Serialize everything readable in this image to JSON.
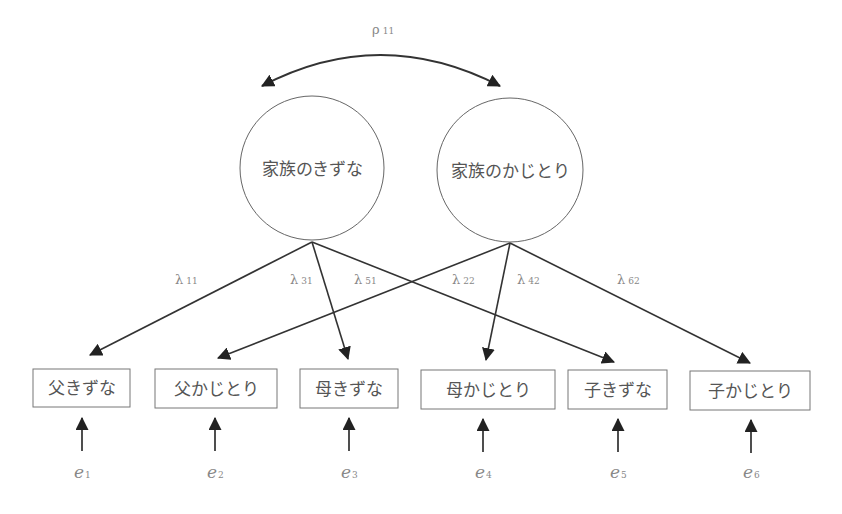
{
  "diagram": {
    "type": "structural-equation-model",
    "colors": {
      "line": "#333333",
      "text": "#555555",
      "param_text": "#888888",
      "background": "#ffffff"
    },
    "correlation": {
      "symbol": "ρ",
      "subscript": "11"
    },
    "latent": [
      {
        "id": "f1",
        "label": "家族のきずな",
        "cx": 312,
        "cy": 168,
        "r": 72
      },
      {
        "id": "f2",
        "label": "家族のかじとり",
        "cx": 510,
        "cy": 170,
        "r": 73
      }
    ],
    "observed": [
      {
        "id": "x1",
        "label": "父きずな",
        "x": 33,
        "y": 369,
        "w": 97,
        "h": 38
      },
      {
        "id": "x2",
        "label": "父かじとり",
        "x": 155,
        "y": 369,
        "w": 122,
        "h": 39
      },
      {
        "id": "x3",
        "label": "母きずな",
        "x": 300,
        "y": 369,
        "w": 98,
        "h": 39
      },
      {
        "id": "x4",
        "label": "母かじとり",
        "x": 421,
        "y": 370,
        "w": 134,
        "h": 39
      },
      {
        "id": "x5",
        "label": "子きずな",
        "x": 568,
        "y": 370,
        "w": 99,
        "h": 39
      },
      {
        "id": "x6",
        "label": "子かじとり",
        "x": 690,
        "y": 371,
        "w": 120,
        "h": 39
      }
    ],
    "loadings": [
      {
        "symbol": "λ",
        "subscript": "11",
        "from": "f1",
        "to": "x1"
      },
      {
        "symbol": "λ",
        "subscript": "31",
        "from": "f1",
        "to": "x3"
      },
      {
        "symbol": "λ",
        "subscript": "51",
        "from": "f1",
        "to": "x5"
      },
      {
        "symbol": "λ",
        "subscript": "22",
        "from": "f2",
        "to": "x2"
      },
      {
        "symbol": "λ",
        "subscript": "42",
        "from": "f2",
        "to": "x4"
      },
      {
        "symbol": "λ",
        "subscript": "62",
        "from": "f2",
        "to": "x6"
      }
    ],
    "errors": [
      {
        "symbol": "e",
        "subscript": "1"
      },
      {
        "symbol": "e",
        "subscript": "2"
      },
      {
        "symbol": "e",
        "subscript": "3"
      },
      {
        "symbol": "e",
        "subscript": "4"
      },
      {
        "symbol": "e",
        "subscript": "5"
      },
      {
        "symbol": "e",
        "subscript": "6"
      }
    ]
  }
}
